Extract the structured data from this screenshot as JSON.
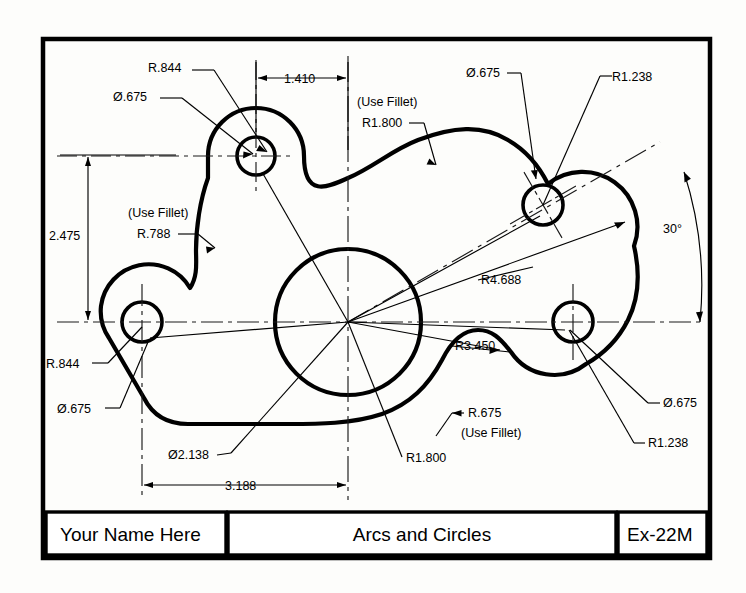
{
  "sheet": {
    "background": "#fdfdfb",
    "ink": "#000000",
    "border": {
      "x": 41,
      "y": 37,
      "w": 671,
      "h": 523,
      "stroke_width": 4
    }
  },
  "title_block": {
    "name_field": "Your Name Here",
    "drawing_title": "Arcs and Circles",
    "exercise_number": "Ex-22M"
  },
  "drawing": {
    "description": "Mechanical part outline with four bolt holes, one large central bore, tangent arcs and fillets",
    "annotations": [
      {
        "id": "ul-boss-radius",
        "text": "R.844",
        "x": 148,
        "y": 72,
        "anchor": "start"
      },
      {
        "id": "ul-hole-dia",
        "text": "Ø.675",
        "x": 113,
        "y": 101,
        "anchor": "start"
      },
      {
        "id": "top-width-dim",
        "text": "1.410",
        "x": 284,
        "y": 76,
        "anchor": "start"
      },
      {
        "id": "top-fillet-note",
        "text": "(Use Fillet)",
        "x": 357,
        "y": 106,
        "anchor": "start"
      },
      {
        "id": "top-fillet-radius",
        "text": "R1.800",
        "x": 362,
        "y": 127,
        "anchor": "start"
      },
      {
        "id": "ur-hole-dia",
        "text": "Ø.675",
        "x": 466,
        "y": 77,
        "anchor": "start"
      },
      {
        "id": "ur-boss-radius",
        "text": "R1.238",
        "x": 610,
        "y": 81,
        "anchor": "start"
      },
      {
        "id": "angle-dim",
        "text": "30°",
        "x": 663,
        "y": 233,
        "anchor": "start"
      },
      {
        "id": "left-height-dim",
        "text": "2.475",
        "x": 49,
        "y": 240,
        "anchor": "start"
      },
      {
        "id": "left-fillet-note",
        "text": "(Use Fillet)",
        "x": 128,
        "y": 217,
        "anchor": "start"
      },
      {
        "id": "left-fillet-radius",
        "text": "R.788",
        "x": 137,
        "y": 238,
        "anchor": "start"
      },
      {
        "id": "bolt-circle-radius",
        "text": "R4.688",
        "x": 481,
        "y": 284,
        "anchor": "start"
      },
      {
        "id": "inner-circle-radius",
        "text": "R3.450",
        "x": 455,
        "y": 350,
        "anchor": "start"
      },
      {
        "id": "ll-boss-radius",
        "text": "R.844",
        "x": 46,
        "y": 368,
        "anchor": "start"
      },
      {
        "id": "ll-hole-dia",
        "text": "Ø.675",
        "x": 57,
        "y": 413,
        "anchor": "start"
      },
      {
        "id": "lr-hole-dia",
        "text": "Ø.675",
        "x": 663,
        "y": 407,
        "anchor": "start"
      },
      {
        "id": "lr-boss-radius",
        "text": "R1.238",
        "x": 648,
        "y": 447,
        "anchor": "start"
      },
      {
        "id": "bottom-fillet-radius",
        "text": "R.675",
        "x": 468,
        "y": 417,
        "anchor": "start"
      },
      {
        "id": "bottom-fillet-note",
        "text": "(Use Fillet)",
        "x": 461,
        "y": 437,
        "anchor": "start"
      },
      {
        "id": "center-bore-dia",
        "text": "Ø2.138",
        "x": 168,
        "y": 459,
        "anchor": "start"
      },
      {
        "id": "bottom-width-dim",
        "text": "3.188",
        "x": 225,
        "y": 489,
        "anchor": "start"
      },
      {
        "id": "bottom-arc-radius",
        "text": "R1.800",
        "x": 404,
        "y": 462,
        "anchor": "start"
      }
    ],
    "features": {
      "center_bore": {
        "cx": 348,
        "cy": 322,
        "r": 73
      },
      "hole_upper_left": {
        "cx": 256,
        "cy": 156,
        "r": 19
      },
      "hole_upper_right": {
        "cx": 543,
        "cy": 205,
        "r": 20
      },
      "hole_lower_left": {
        "cx": 142,
        "cy": 322,
        "r": 20
      },
      "hole_lower_right": {
        "cx": 573,
        "cy": 322,
        "r": 20
      }
    }
  }
}
